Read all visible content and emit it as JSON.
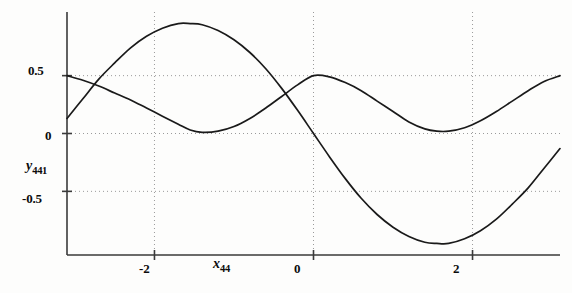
{
  "chart_data": {
    "type": "line",
    "title": "",
    "xlabel": "x44",
    "xlabel_base": "x",
    "xlabel_sub": "44",
    "ylabel": "y441",
    "ylabel_base": "y",
    "ylabel_sub": "441",
    "xlim": [
      -3.1,
      3.1
    ],
    "ylim": [
      -1.05,
      1.05
    ],
    "xticks": [
      -2,
      0,
      2
    ],
    "xtick_labels": [
      "-2",
      "0",
      "2"
    ],
    "yticks": [
      0.5,
      0,
      -0.5
    ],
    "ytick_labels": [
      "0.5",
      "0",
      "-0.5"
    ],
    "grid": true,
    "grid_style": "dotted",
    "legend": "none",
    "axis_color": "#3a3a3a",
    "curve_color": "#1a1a1a",
    "grid_color": "#9a9a9a",
    "series": [
      {
        "name": "sine-wave",
        "description": "large-amplitude sinusoid, peak near x=-1.55 at y=0.95, zero crossing at x=0 descending, trough near x=1.55 at y=-0.95",
        "x": [
          -3.1,
          -2.9,
          -2.7,
          -2.5,
          -2.3,
          -2.1,
          -1.9,
          -1.7,
          -1.55,
          -1.4,
          -1.2,
          -1.0,
          -0.8,
          -0.6,
          -0.4,
          -0.2,
          0.0,
          0.2,
          0.4,
          0.6,
          0.8,
          1.0,
          1.2,
          1.4,
          1.55,
          1.7,
          1.9,
          2.1,
          2.3,
          2.5,
          2.7,
          2.9,
          3.1
        ],
        "y": [
          0.13,
          0.3,
          0.47,
          0.61,
          0.74,
          0.84,
          0.91,
          0.95,
          0.95,
          0.94,
          0.89,
          0.81,
          0.7,
          0.56,
          0.39,
          0.2,
          0.0,
          -0.2,
          -0.39,
          -0.56,
          -0.7,
          -0.81,
          -0.89,
          -0.94,
          -0.95,
          -0.95,
          -0.91,
          -0.84,
          -0.74,
          -0.61,
          -0.47,
          -0.3,
          -0.13
        ]
      },
      {
        "name": "raised-cosine-wave",
        "description": "half-amplitude non-negative wave, 0.5 at left edge, minimum 0.0 near x=-1.55, peak 0.5 at x=0, minimum 0.02 near x=1.55, rising to 0.5 at right edge",
        "x": [
          -3.1,
          -2.9,
          -2.7,
          -2.5,
          -2.3,
          -2.1,
          -1.9,
          -1.7,
          -1.55,
          -1.4,
          -1.2,
          -1.0,
          -0.8,
          -0.6,
          -0.4,
          -0.2,
          0.0,
          0.2,
          0.4,
          0.6,
          0.8,
          1.0,
          1.2,
          1.4,
          1.55,
          1.7,
          1.9,
          2.1,
          2.3,
          2.5,
          2.7,
          2.9,
          3.1
        ],
        "y": [
          0.5,
          0.46,
          0.41,
          0.35,
          0.29,
          0.22,
          0.15,
          0.08,
          0.03,
          0.01,
          0.02,
          0.06,
          0.13,
          0.22,
          0.32,
          0.42,
          0.5,
          0.49,
          0.44,
          0.37,
          0.28,
          0.19,
          0.1,
          0.04,
          0.02,
          0.02,
          0.05,
          0.11,
          0.19,
          0.28,
          0.37,
          0.45,
          0.5
        ]
      }
    ]
  }
}
